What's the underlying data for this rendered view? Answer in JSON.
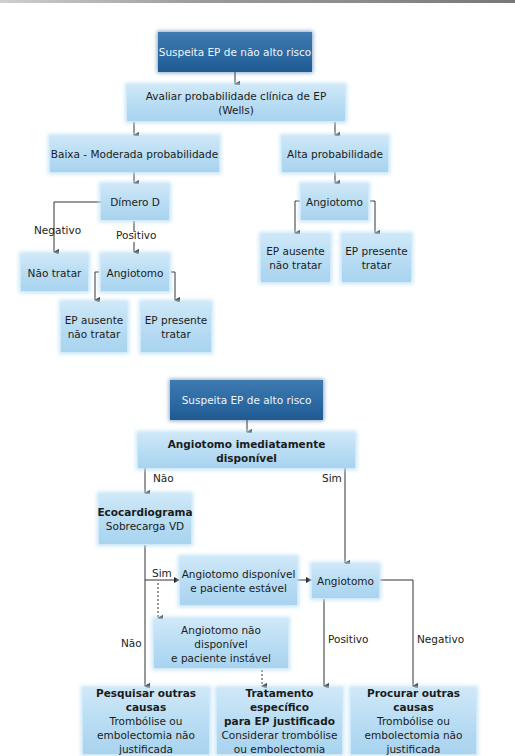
{
  "diagram_1": {
    "start": "Suspeita EP de não alto risco",
    "assess": "Avaliar probabilidade clínica de EP (Wells)",
    "low_mod": "Baixa - Moderada probabilidade",
    "high": "Alta probabilidade",
    "ddimer": "Dímero D",
    "neg_label": "Negativo",
    "pos_label": "Positivo",
    "no_treat": "Não tratar",
    "angio_left": "Angiotomo",
    "angio_right": "Angiotomo",
    "left_absent_1": "EP ausente",
    "left_absent_2": "não tratar",
    "left_present_1": "EP presente",
    "left_present_2": "tratar",
    "right_absent_1": "EP ausente",
    "right_absent_2": "não tratar",
    "right_present_1": "EP presente",
    "right_present_2": "tratar"
  },
  "diagram_2": {
    "start": "Suspeita EP de alto risco",
    "available": "Angiotomo imediatamente disponível",
    "no_label": "Não",
    "yes_label": "Sim",
    "echo_title": "Ecocardiograma",
    "echo_sub": "Sobrecarga VD",
    "echo_yes_label": "Sim",
    "echo_no_label": "Não",
    "stable_1": "Angiotomo disponível",
    "stable_2": "e paciente estável",
    "unstable_1": "Angiotomo não disponível",
    "unstable_2": "e paciente instável",
    "angio": "Angiotomo",
    "positive_label": "Positivo",
    "negative_label": "Negativo",
    "outcome_left": {
      "title": "Pesquisar outras causas",
      "line1": "Trombólise ou",
      "line2": "embolectomia não",
      "line3": "justificada"
    },
    "outcome_mid": {
      "title1": "Tratamento específico",
      "title2": "para EP justificado",
      "line1": "Considerar trombólise",
      "line2": "ou embolectomia"
    },
    "outcome_right": {
      "title": "Procurar outras causas",
      "line1": "Trombólise ou",
      "line2": "embolectomia não",
      "line3": "justificada"
    }
  },
  "colors": {
    "dark_box": "#2d6aa3",
    "light_box": "#b7dcf3",
    "line": "#333333"
  }
}
